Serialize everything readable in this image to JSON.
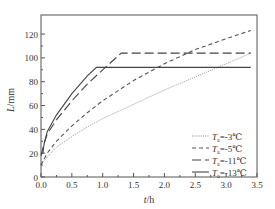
{
  "chart_data": {
    "type": "line",
    "title": "",
    "xlabel": "t/h",
    "ylabel": "L/mm",
    "xlim": [
      0,
      3.5
    ],
    "ylim": [
      0,
      136
    ],
    "xticks": [
      "0.0",
      "0.5",
      "1.0",
      "1.5",
      "2.0",
      "2.5",
      "3.0",
      "3.5"
    ],
    "yticks": [
      "0",
      "20",
      "40",
      "60",
      "80",
      "100",
      "120"
    ],
    "grid": false,
    "legend_position": "lower right",
    "series": [
      {
        "name": "Ta=-3℃",
        "label_sub": "a",
        "label_temp": "=-3℃",
        "style": "dotted",
        "x": [
          0,
          0.1,
          0.25,
          0.5,
          0.75,
          1.0,
          1.5,
          2.0,
          2.5,
          3.0,
          3.4
        ],
        "y": [
          10,
          17,
          25,
          34,
          42,
          49,
          61,
          73,
          84,
          95,
          104
        ]
      },
      {
        "name": "Ta=-5℃",
        "label_sub": "a",
        "label_temp": "=-5℃",
        "style": "short-dash",
        "x": [
          0,
          0.1,
          0.25,
          0.5,
          0.75,
          1.0,
          1.5,
          2.0,
          2.5,
          3.0,
          3.4
        ],
        "y": [
          10,
          20,
          30,
          43,
          54,
          64,
          81,
          95,
          107,
          116,
          123
        ]
      },
      {
        "name": "Ta=-11℃",
        "label_sub": "a",
        "label_temp": "=-11℃",
        "style": "long-dash",
        "x": [
          0,
          0.05,
          0.1,
          0.25,
          0.5,
          0.75,
          1.0,
          1.3,
          1.4,
          3.4
        ],
        "y": [
          18,
          28,
          36,
          48,
          64,
          78,
          90,
          104,
          104,
          104
        ]
      },
      {
        "name": "Ta=-13℃",
        "label_sub": "a",
        "label_temp": "=-13℃",
        "style": "solid",
        "x": [
          0,
          0.03,
          0.05,
          0.1,
          0.25,
          0.5,
          0.75,
          0.9,
          3.4
        ],
        "y": [
          20,
          20,
          28,
          38,
          52,
          70,
          85,
          92,
          92
        ]
      }
    ]
  },
  "legend": {
    "items": [
      {
        "prefix": "T",
        "sub": "a",
        "suffix": "=-3℃"
      },
      {
        "prefix": "T",
        "sub": "a",
        "suffix": "=-5℃"
      },
      {
        "prefix": "T",
        "sub": "a",
        "suffix": "=-11℃"
      },
      {
        "prefix": "T",
        "sub": "a",
        "suffix": "=-13℃"
      }
    ]
  },
  "axes": {
    "x_label_italic": "t",
    "x_label_unit": "/h",
    "y_label_italic": "L",
    "y_label_unit": "/mm"
  }
}
